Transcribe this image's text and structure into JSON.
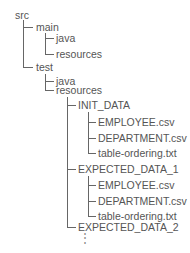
{
  "tree": {
    "clipped_header": "",
    "root": "src",
    "main": "main",
    "main_java": "java",
    "main_resources": "resources",
    "test": "test",
    "test_java": "java",
    "test_resources": "resources",
    "init_data": "INIT_DATA",
    "init_employee": "EMPLOYEE.csv",
    "init_department": "DEPARTMENT.csv",
    "init_table_ordering": "table-ordering.txt",
    "expected_1": "EXPECTED_DATA_1",
    "exp1_employee": "EMPLOYEE.csv",
    "exp1_department": "DEPARTMENT.csv",
    "exp1_table_ordering": "table-ordering.txt",
    "expected_2": "EXPECTED_DATA_2",
    "continuation": "⋮"
  }
}
